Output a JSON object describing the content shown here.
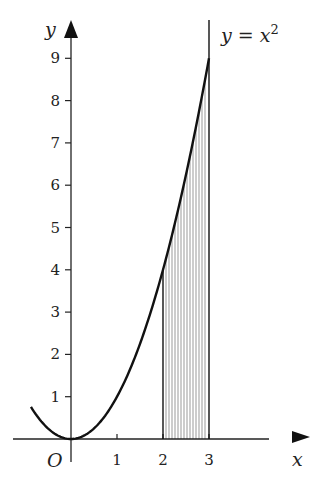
{
  "chart_data": {
    "type": "area",
    "title": "",
    "curve_label": "y = x",
    "curve_label_exponent": "2",
    "function": "y = x^2",
    "xlabel": "x",
    "ylabel": "y",
    "origin_label": "O",
    "x_ticks": [
      "1",
      "2",
      "3"
    ],
    "x_tick_values": [
      1,
      2,
      3
    ],
    "y_ticks": [
      "1",
      "2",
      "3",
      "4",
      "5",
      "6",
      "7",
      "8",
      "9"
    ],
    "y_tick_values": [
      1,
      2,
      3,
      4,
      5,
      6,
      7,
      8,
      9
    ],
    "xlim": [
      -1.3,
      4.3
    ],
    "ylim": [
      0,
      9.5
    ],
    "shaded_region": {
      "x_from": 2,
      "x_to": 3,
      "description": "area under y = x^2 between x = 2 and x = 3, vertical hatching"
    },
    "curve_domain": [
      -0.87,
      3
    ],
    "points": [
      [
        -0.87,
        0.76
      ],
      [
        0,
        0
      ],
      [
        1,
        1
      ],
      [
        2,
        4
      ],
      [
        3,
        9
      ]
    ],
    "vertical_line_x": 3,
    "grid": false,
    "legend": "none",
    "colors": {
      "line": "#111111",
      "hatch": "#555555",
      "axis": "#222222"
    }
  }
}
